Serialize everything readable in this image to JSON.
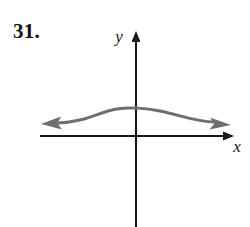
{
  "exercise": {
    "number": "31."
  },
  "figure": {
    "kind": "coordinate-plane-graph",
    "background_color": "#ffffff",
    "axis_color": "#1a1a1a",
    "curve_color": "#6e6e6e",
    "axes": {
      "x_label": "x",
      "y_label": "y",
      "origin": {
        "x": 136,
        "y": 136
      },
      "x_axis": {
        "start_x": 40,
        "end_x": 234,
        "y": 136,
        "arrow_right": true,
        "arrow_left": false
      },
      "y_axis": {
        "x": 136,
        "start_y": 227,
        "end_y": 31,
        "arrow_up": true,
        "arrow_down": false
      },
      "x_label_position": {
        "x": 237,
        "y": 152
      },
      "y_label_position": {
        "x": 119,
        "y": 42
      }
    },
    "curve": {
      "description": "smooth single-bump wave crossing above the x-axis, arrowheads on both ends",
      "stroke_width": 3,
      "arrow_left": true,
      "arrow_right": true,
      "left_arrow_tip": {
        "x": 41,
        "y": 124
      },
      "right_arrow_tip": {
        "x": 231,
        "y": 125
      },
      "apex": {
        "x": 137,
        "y": 108
      },
      "path": "M 58 123 C 86 122 98 112 117 109 C 128 107 146 108 160 111 C 180 115 196 122 214 122"
    }
  }
}
